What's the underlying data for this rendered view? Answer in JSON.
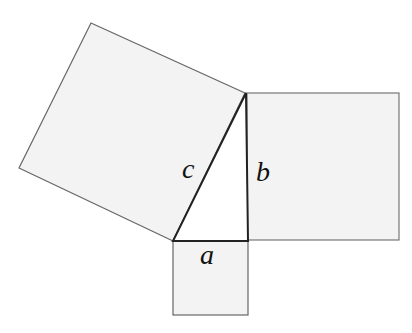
{
  "diagram": {
    "type": "pythagorean-theorem",
    "colors": {
      "square_fill": "#f3f3f3",
      "square_stroke": "#666666",
      "triangle_fill": "#ffffff",
      "triangle_stroke": "#222222",
      "background": "#ffffff"
    },
    "labels": {
      "hypotenuse": "c",
      "vertical_leg": "b",
      "horizontal_leg": "a"
    },
    "shapes": {
      "square_c": [
        [
          91,
          23
        ],
        [
          245,
          93
        ],
        [
          173,
          241
        ],
        [
          19,
          168
        ]
      ],
      "square_b": [
        [
          247,
          93
        ],
        [
          399,
          93
        ],
        [
          399,
          240
        ],
        [
          247,
          240
        ]
      ],
      "square_a": [
        [
          173,
          241
        ],
        [
          248,
          241
        ],
        [
          248,
          315
        ],
        [
          173,
          315
        ]
      ],
      "triangle": [
        [
          246,
          93
        ],
        [
          248,
          241
        ],
        [
          173,
          241
        ]
      ]
    }
  }
}
